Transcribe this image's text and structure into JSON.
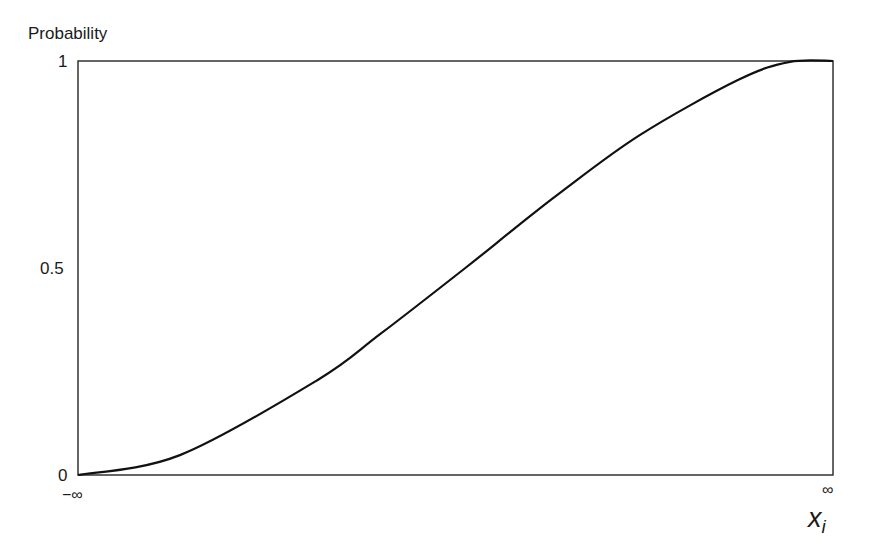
{
  "chart_data": {
    "type": "line",
    "title": "",
    "xlabel": "x_i",
    "ylabel": "Probability",
    "x_tick_labels": [
      "−∞",
      "∞"
    ],
    "y_tick_labels": [
      "0",
      "0.5",
      "1"
    ],
    "ylim": [
      0,
      1
    ],
    "grid": false,
    "legend": null,
    "series": [
      {
        "name": "cumulative distribution",
        "x_normalized": [
          0,
          0.135,
          0.317,
          0.4,
          0.513,
          0.576,
          0.638,
          0.744,
          0.874,
          0.943,
          1
        ],
        "values": [
          0,
          0.048,
          0.229,
          0.34,
          0.5,
          0.592,
          0.681,
          0.821,
          0.954,
          0.998,
          1
        ]
      }
    ]
  },
  "labels": {
    "ylabel": "Probability",
    "y_top": "1",
    "y_mid": "0.5",
    "y_bottom": "0",
    "x_left": "−∞",
    "x_right": "∞",
    "x_var": "x",
    "x_sub": "i"
  }
}
